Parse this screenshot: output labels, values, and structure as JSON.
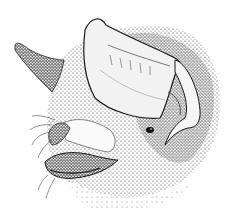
{
  "image": {
    "subject": "bat head illustration",
    "style": "pen-and-ink stipple drawing",
    "colors": {
      "background": "#ffffff",
      "ink": "#1a1a1a",
      "midtone": "#6b6b6b",
      "light": "#bdbdbd"
    }
  }
}
